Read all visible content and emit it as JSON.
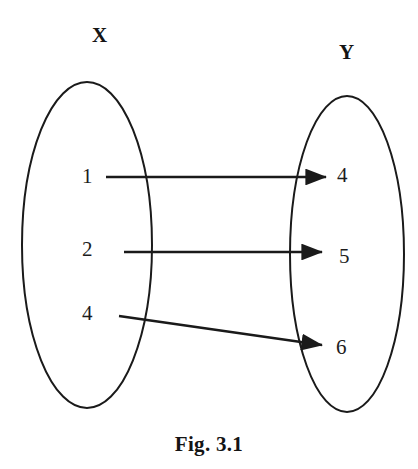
{
  "figure": {
    "caption": "Fig. 3.1",
    "type": "mapping-diagram",
    "background_color": "#ffffff",
    "ink_color": "#1a1a1a"
  },
  "sets": {
    "domain": {
      "label": "X",
      "elements": [
        "1",
        "2",
        "4"
      ]
    },
    "codomain": {
      "label": "Y",
      "elements": [
        "4",
        "5",
        "6"
      ]
    }
  },
  "mappings": [
    {
      "from": "1",
      "to": "4"
    },
    {
      "from": "2",
      "to": "5"
    },
    {
      "from": "4",
      "to": "6"
    }
  ],
  "geometry": {
    "left_ellipse": {
      "cx": 87,
      "cy": 245,
      "rx": 65,
      "ry": 163
    },
    "right_ellipse": {
      "cx": 347,
      "cy": 254,
      "rx": 57,
      "ry": 158
    },
    "arrows": [
      {
        "x1": 106,
        "y1": 177,
        "x2": 326,
        "y2": 177
      },
      {
        "x1": 124,
        "y1": 252,
        "x2": 322,
        "y2": 252
      },
      {
        "x1": 119,
        "y1": 316,
        "x2": 322,
        "y2": 345
      }
    ],
    "stroke_width": 2
  }
}
